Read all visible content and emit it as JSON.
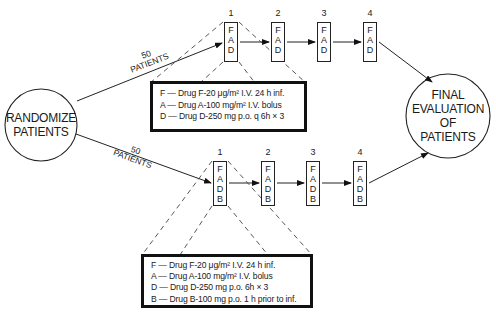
{
  "start_node": {
    "line1": "RANDOMIZE",
    "line2": "PATIENTS"
  },
  "end_node": {
    "line1": "FINAL",
    "line2": "EVALUATION",
    "line3": "OF",
    "line4": "PATIENTS"
  },
  "arm_a": {
    "count": "50",
    "count_label": "PATIENTS",
    "cycles": [
      {
        "number": "1",
        "drugs": [
          "F",
          "A",
          "D"
        ]
      },
      {
        "number": "2",
        "drugs": [
          "F",
          "A",
          "D"
        ]
      },
      {
        "number": "3",
        "drugs": [
          "F",
          "A",
          "D"
        ]
      },
      {
        "number": "4",
        "drugs": [
          "F",
          "A",
          "D"
        ]
      }
    ],
    "legend": [
      "F — Drug F-20 μg/m² I.V. 24 h inf.",
      "A — Drug A-100 mg/m² I.V. bolus",
      "D — Drug D-250 mg p.o. q 6h  ×  3"
    ]
  },
  "arm_b": {
    "count": "50",
    "count_label": "PATIENTS",
    "cycles": [
      {
        "number": "1",
        "drugs": [
          "F",
          "A",
          "D",
          "B"
        ]
      },
      {
        "number": "2",
        "drugs": [
          "F",
          "A",
          "D",
          "B"
        ]
      },
      {
        "number": "3",
        "drugs": [
          "F",
          "A",
          "D",
          "B"
        ]
      },
      {
        "number": "4",
        "drugs": [
          "F",
          "A",
          "D",
          "B"
        ]
      }
    ],
    "legend": [
      "F — Drug F-20 μg/m² I.V. 24 h inf.",
      "A — Drug A-100 mg/m² I.V. bolus",
      "D — Drug D-250 mg p.o. 6h  ×  3",
      "B — Drug B-100 mg p.o. 1 h prior to inf."
    ]
  }
}
